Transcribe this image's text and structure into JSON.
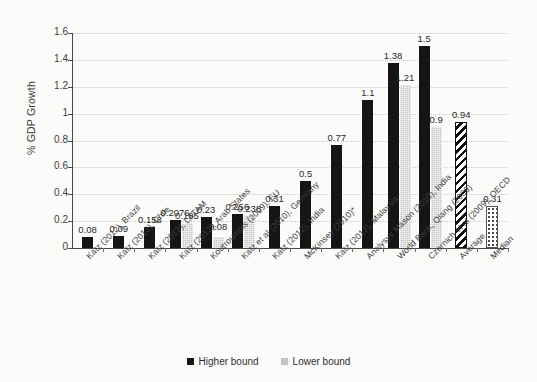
{
  "chart_data": {
    "type": "bar",
    "title": "",
    "subtitle": "",
    "xlabel": "",
    "ylabel": "% GDP Growth",
    "ylim": [
      0,
      1.6
    ],
    "yticks": [
      "0",
      "0.2",
      "0.4",
      "0.6",
      "0.8",
      "1",
      "1.2",
      "1.4",
      "1.6"
    ],
    "grid": true,
    "legend_position": "bottom-center",
    "categories": [
      "Katz (2012), Brazil",
      "Katz (2012), Chile",
      "Katz (2012), LATAM",
      "Katz (2012), Arab States",
      "Koutroumpis (2009), EU",
      "Katz et al (2010), Germany",
      "Katz (2012), India",
      "McKinsey (2010)*",
      "Katz (2012), Malaysia",
      "Analysys Mason (2010), India",
      "World Bank, Qiang (2009)",
      "Czernich et al (2009), OECD",
      "Average",
      "Median"
    ],
    "series": [
      {
        "name": "Higher bound",
        "color": "#151515",
        "values": [
          0.08,
          0.09,
          0.158,
          0.2076,
          0.23,
          0.256,
          0.31,
          0.5,
          0.77,
          1.1,
          1.38,
          1.5,
          null,
          null
        ]
      },
      {
        "name": "Lower bound",
        "color": "#c4c4c4",
        "values": [
          null,
          null,
          null,
          0.185,
          0.08,
          0.238,
          null,
          null,
          null,
          null,
          1.21,
          0.9,
          null,
          null
        ]
      },
      {
        "name": "Summary",
        "color": "#ffffff",
        "values": [
          null,
          null,
          null,
          null,
          null,
          null,
          null,
          null,
          null,
          null,
          null,
          null,
          0.94,
          0.31
        ]
      }
    ],
    "data_labels": {
      "higher": [
        "0.08",
        "0.09",
        "0.158",
        "0.2076",
        "0.23",
        "0.256",
        "0.31",
        "0.5",
        "0.77",
        "1.1",
        "1.38",
        "1.5",
        "",
        ""
      ],
      "lower": [
        "",
        "",
        "",
        "0.185",
        "0.08",
        "0.238",
        "",
        "",
        "",
        "",
        "1.21",
        "0.9",
        "",
        ""
      ],
      "summary": [
        "",
        "",
        "",
        "",
        "",
        "",
        "",
        "",
        "",
        "",
        "",
        "",
        "0.94",
        "0.31"
      ]
    },
    "summary_bars": [
      {
        "label": "Average",
        "value": 0.94,
        "pattern": "diagonal-hatch"
      },
      {
        "label": "Median",
        "value": 0.31,
        "pattern": "dotted"
      }
    ]
  },
  "legend": {
    "items": [
      {
        "label": "Higher bound",
        "swatch": "higher"
      },
      {
        "label": "Lower bound",
        "swatch": "lower"
      }
    ]
  }
}
